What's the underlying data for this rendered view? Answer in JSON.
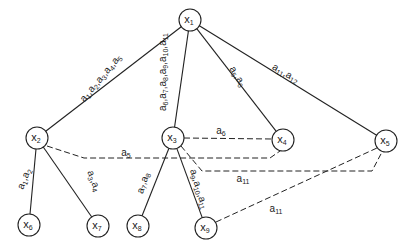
{
  "diagram": {
    "type": "tree-with-cross-links",
    "nodes": [
      {
        "id": "x1",
        "base": "x",
        "sub": "1",
        "cx": 190,
        "cy": 20
      },
      {
        "id": "x2",
        "base": "x",
        "sub": "2",
        "cx": 37,
        "cy": 138
      },
      {
        "id": "x3",
        "base": "x",
        "sub": "3",
        "cx": 173,
        "cy": 138
      },
      {
        "id": "x4",
        "base": "x",
        "sub": "4",
        "cx": 283,
        "cy": 140
      },
      {
        "id": "x5",
        "base": "x",
        "sub": "5",
        "cx": 386,
        "cy": 141
      },
      {
        "id": "x6",
        "base": "x",
        "sub": "6",
        "cx": 29,
        "cy": 225
      },
      {
        "id": "x7",
        "base": "x",
        "sub": "7",
        "cx": 98,
        "cy": 226
      },
      {
        "id": "x8",
        "base": "x",
        "sub": "8",
        "cx": 138,
        "cy": 226
      },
      {
        "id": "x9",
        "base": "x",
        "sub": "9",
        "cx": 206,
        "cy": 228
      }
    ],
    "solid_edges": [
      {
        "from": "x1",
        "to": "x2",
        "label": "a1,a2,a3,a4,a5",
        "parts": [
          [
            "a",
            "1"
          ],
          [
            "a",
            "2"
          ],
          [
            "a",
            "3"
          ],
          [
            "a",
            "4"
          ],
          [
            "a",
            "5"
          ]
        ],
        "lx": 103,
        "ly": 80,
        "angle": -50
      },
      {
        "from": "x1",
        "to": "x3",
        "label": "a6,a7,a8,a9,a10,a11",
        "parts": [
          [
            "a",
            "6"
          ],
          [
            "a",
            "7"
          ],
          [
            "a",
            "8"
          ],
          [
            "a",
            "9"
          ],
          [
            "a",
            "10"
          ],
          [
            "a",
            "11"
          ]
        ],
        "lx": 166,
        "ly": 72,
        "angle": -90
      },
      {
        "from": "x1",
        "to": "x4",
        "label": "a5,a6",
        "parts": [
          [
            "a",
            "5"
          ],
          [
            "a",
            "6"
          ]
        ],
        "lx": 235,
        "ly": 78,
        "angle": 58
      },
      {
        "from": "x1",
        "to": "x5",
        "label": "a11,a12",
        "parts": [
          [
            "a",
            "11"
          ],
          [
            "a",
            "12"
          ]
        ],
        "lx": 284,
        "ly": 76,
        "angle": 30
      },
      {
        "from": "x2",
        "to": "x6",
        "label": "a1,a2",
        "parts": [
          [
            "a",
            "1"
          ],
          [
            "a",
            "2"
          ]
        ],
        "lx": 27,
        "ly": 180,
        "angle": -68
      },
      {
        "from": "x2",
        "to": "x7",
        "label": "a3,a4",
        "parts": [
          [
            "a",
            "3"
          ],
          [
            "a",
            "4"
          ]
        ],
        "lx": 91,
        "ly": 182,
        "angle": 70
      },
      {
        "from": "x3",
        "to": "x8",
        "label": "a7,a8",
        "parts": [
          [
            "a",
            "7"
          ],
          [
            "a",
            "8"
          ]
        ],
        "lx": 146,
        "ly": 184,
        "angle": -72
      },
      {
        "from": "x3",
        "to": "x9",
        "label": "a9,a10,a11",
        "parts": [
          [
            "a",
            "9"
          ],
          [
            "a",
            "10"
          ],
          [
            "a",
            "11"
          ]
        ],
        "lx": 196,
        "ly": 190,
        "angle": 73
      }
    ],
    "dashed_edges": [
      {
        "from": "x2",
        "to": "x4",
        "label": "a5",
        "parts": [
          [
            "a",
            "5"
          ]
        ],
        "points": "47,146 84,158 270,158 280,151",
        "lx": 126,
        "ly": 156
      },
      {
        "from": "x3",
        "to": "x4",
        "label": "a6",
        "parts": [
          [
            "a",
            "6"
          ]
        ],
        "points": "184,138 272,139",
        "lx": 221,
        "ly": 134
      },
      {
        "from": "x3",
        "to": "x5",
        "label": "a11",
        "parts": [
          [
            "a",
            "11"
          ]
        ],
        "points": "181,146 202,171 372,171 382,152",
        "lx": 243,
        "ly": 182
      },
      {
        "from": "x9",
        "to": "x5",
        "label": "a11",
        "parts": [
          [
            "a",
            "11"
          ]
        ],
        "points": "216,222 377,148",
        "lx": 276,
        "ly": 212
      }
    ],
    "node_radius": 11,
    "stroke_color": "#222222",
    "background": "#ffffff"
  }
}
